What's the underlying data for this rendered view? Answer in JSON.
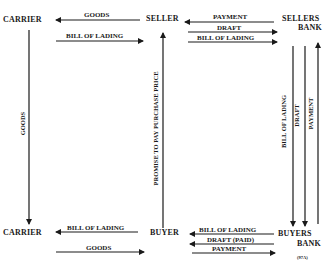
{
  "nodes": {
    "carrier_top": "CARRIER",
    "seller": "SELLER",
    "sellers_bank_line1": "SELLERS",
    "sellers_bank_line2": "BANK",
    "carrier_bottom": "CARRIER",
    "buyer": "BUYER",
    "buyers_bank_line1": "BUYERS",
    "buyers_bank_line2": "BANK"
  },
  "arrows": {
    "seller_to_carrier": "GOODS",
    "carrier_to_seller": "BILL OF LADING",
    "sellersbank_to_seller": "PAYMENT",
    "seller_to_sellersbank_draft": "DRAFT",
    "seller_to_sellersbank_bol": "BILL OF LADING",
    "carrier_top_to_bottom": "GOODS",
    "buyer_to_seller": "PROMISE TO PAY PURCHASE PRICE",
    "sellersbank_to_buyersbank_bol": "BILL OF LADING",
    "sellersbank_to_buyersbank_draft": "DRAFT",
    "buyersbank_to_sellersbank_payment": "PAYMENT",
    "buyer_to_carrier": "BILL OF LADING",
    "carrier_to_buyer": "GOODS",
    "buyersbank_to_buyer_bol": "BILL OF LADING",
    "buyersbank_to_buyer_draft": "DRAFT (PAID)",
    "buyer_to_buyersbank_payment": "PAYMENT"
  },
  "figure_code": "(97A)"
}
